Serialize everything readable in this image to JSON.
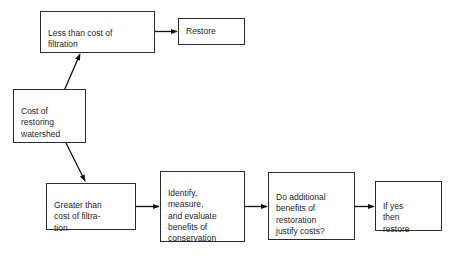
{
  "diagram": {
    "background_color": "#ffffff",
    "line_color": "#2b2b2b",
    "text_color": "#262626",
    "nodes": [
      {
        "id": "less-than-cost",
        "text": "Less than cost of\nfiltration",
        "x": 40,
        "y": 11,
        "w": 115,
        "h": 42
      },
      {
        "id": "restore",
        "text": "Restore",
        "x": 178,
        "y": 18,
        "w": 67,
        "h": 27
      },
      {
        "id": "cost-of-restoring",
        "text": "Cost of\nrestoring\nwatershed",
        "x": 13,
        "y": 89,
        "w": 73,
        "h": 54
      },
      {
        "id": "greater-than-cost",
        "text": "Greater than\ncost of filtra-\ntion",
        "x": 46,
        "y": 183,
        "w": 90,
        "h": 47
      },
      {
        "id": "identify-measure-evaluate",
        "text": "Identify,\nmeasure,\nand evaluate\nbenefits of\nconservation",
        "x": 160,
        "y": 171,
        "w": 85,
        "h": 71
      },
      {
        "id": "do-additional-benefits",
        "text": "Do additional\nbenefits of\nrestoration\njustify costs?",
        "x": 268,
        "y": 172,
        "w": 87,
        "h": 68
      },
      {
        "id": "if-yes-then-restore",
        "text": "If yes\nthen\nrestore",
        "x": 375,
        "y": 181,
        "w": 67,
        "h": 50
      }
    ],
    "edges": [
      {
        "id": "edge-less-to-restore",
        "from": "less-than-cost",
        "to": "restore",
        "kind": "horizontal"
      },
      {
        "id": "edge-cost-to-less",
        "from": "cost-of-restoring",
        "to": "less-than-cost",
        "kind": "diagonal-up"
      },
      {
        "id": "edge-cost-to-greater",
        "from": "cost-of-restoring",
        "to": "greater-than-cost",
        "kind": "diagonal-down"
      },
      {
        "id": "edge-greater-to-identify",
        "from": "greater-than-cost",
        "to": "identify-measure-evaluate",
        "kind": "horizontal"
      },
      {
        "id": "edge-identify-to-additional",
        "from": "identify-measure-evaluate",
        "to": "do-additional-benefits",
        "kind": "horizontal"
      },
      {
        "id": "edge-additional-to-ifyes",
        "from": "do-additional-benefits",
        "to": "if-yes-then-restore",
        "kind": "horizontal"
      }
    ]
  }
}
